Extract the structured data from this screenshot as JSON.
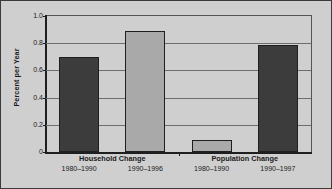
{
  "chart_data": {
    "type": "bar",
    "title": "",
    "xlabel": "",
    "ylabel": "Percent per Year",
    "ylim": [
      0,
      1.0
    ],
    "ytick_labels": [
      "0",
      "0.2",
      "0.4",
      "0.6",
      "0.8",
      "1.0"
    ],
    "ytick_values": [
      0,
      0.2,
      0.4,
      0.6,
      0.8,
      1.0
    ],
    "grid": "horizontal",
    "legend": "none",
    "groups": [
      {
        "name": "Household Change",
        "bars": [
          {
            "label": "1980–1990",
            "value": 0.7,
            "color": "#3c3c3c",
            "style": "dark"
          },
          {
            "label": "1990–1996",
            "value": 0.89,
            "color": "#a9a9a9",
            "style": "light"
          }
        ]
      },
      {
        "name": "Population Change",
        "bars": [
          {
            "label": "1980–1990",
            "value": 0.09,
            "color": "#a9a9a9",
            "style": "light"
          },
          {
            "label": "1990–1997",
            "value": 0.79,
            "color": "#3c3c3c",
            "style": "dark"
          }
        ]
      }
    ],
    "categories": [
      "Household Change 1980–1990",
      "Household Change 1990–1996",
      "Population Change 1980–1990",
      "Population Change 1990–1997"
    ],
    "values": [
      0.7,
      0.89,
      0.09,
      0.79
    ]
  },
  "colors": {
    "background": "#cfcfcf",
    "frame": "#3a3a3a",
    "axis": "#1f1f1f",
    "gridline": "#6e6e6e",
    "bar_dark": "#3c3c3c",
    "bar_light": "#a9a9a9",
    "text": "#1a1a1a"
  }
}
